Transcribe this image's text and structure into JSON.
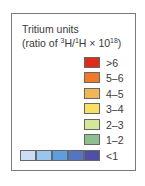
{
  "chart_data": {
    "type": "legend",
    "title": "Tritium units",
    "subtitle": "(ratio of 3H/1H × 10^18)",
    "subtitle_parts": {
      "prefix": "(ratio of ",
      "sup1": "3",
      "mid1": "H/",
      "sup2": "1",
      "mid2": "H × 10",
      "sup3": "18",
      "suffix": ")"
    },
    "entries": [
      {
        "label": ">6",
        "colors": [
          "#e02a1c"
        ]
      },
      {
        "label": "5–6",
        "colors": [
          "#ee7a2a"
        ]
      },
      {
        "label": "4–5",
        "colors": [
          "#f2b55a"
        ]
      },
      {
        "label": "3–4",
        "colors": [
          "#f7e063"
        ]
      },
      {
        "label": "2–3",
        "colors": [
          "#d6e69a"
        ]
      },
      {
        "label": "1–2",
        "colors": [
          "#8fbf8c"
        ]
      },
      {
        "label": "<1",
        "colors": [
          "#c9def4",
          "#99c6ee",
          "#5e9ee0",
          "#5475c4",
          "#4f4fa6"
        ]
      }
    ]
  }
}
